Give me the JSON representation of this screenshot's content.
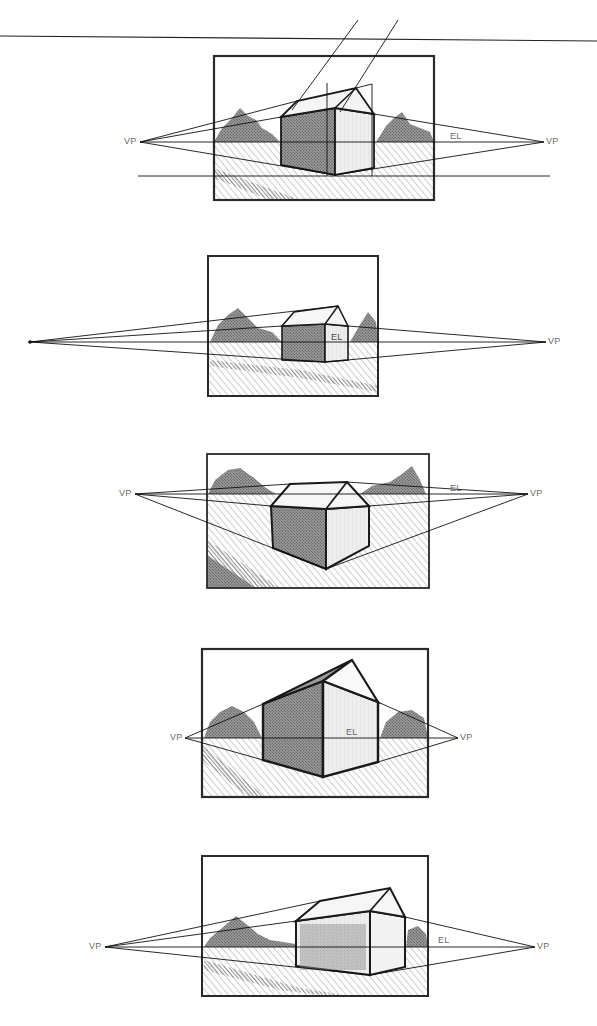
{
  "page": {
    "top_rule": true
  },
  "labels": {
    "vp": "VP",
    "el": "EL"
  },
  "colors": {
    "ink": "#1a1a1a",
    "pencil": "#3a3a3a",
    "label": "#6a6a6a",
    "hatch": "#b5b5b5"
  },
  "panels": [
    {
      "id": 1,
      "frame": [
        114,
        55,
        334,
        200
      ],
      "eye_level_y": 142,
      "vp_left": [
        140,
        142
      ],
      "vp_right": [
        544,
        142
      ],
      "vp_left_label": "VP",
      "vp_right_label": "VP",
      "el_label": "EL",
      "extra_horizon_y": 176,
      "note": "construction lines for roof ridge"
    },
    {
      "id": 2,
      "frame": [
        208,
        255,
        377,
        396
      ],
      "eye_level_y": 342,
      "vp_left": [
        30,
        342
      ],
      "vp_right": [
        546,
        342
      ],
      "vp_left_label": "",
      "vp_right_label": "VP",
      "el_label": "EL"
    },
    {
      "id": 3,
      "frame": [
        207,
        453,
        430,
        589
      ],
      "eye_level_y": 494,
      "vp_left": [
        135,
        494
      ],
      "vp_right": [
        528,
        494
      ],
      "vp_left_label": "VP",
      "vp_right_label": "VP",
      "el_label": "EL"
    },
    {
      "id": 4,
      "frame": [
        202,
        648,
        429,
        797
      ],
      "eye_level_y": 738,
      "vp_left": [
        185,
        738
      ],
      "vp_right": [
        458,
        738
      ],
      "vp_left_label": "VP",
      "vp_right_label": "VP",
      "el_label": "EL"
    },
    {
      "id": 5,
      "frame": [
        202,
        855,
        428,
        997
      ],
      "eye_level_y": 947,
      "vp_left": [
        105,
        947
      ],
      "vp_right": [
        535,
        947
      ],
      "vp_left_label": "VP",
      "vp_right_label": "VP",
      "el_label": "EL"
    }
  ]
}
